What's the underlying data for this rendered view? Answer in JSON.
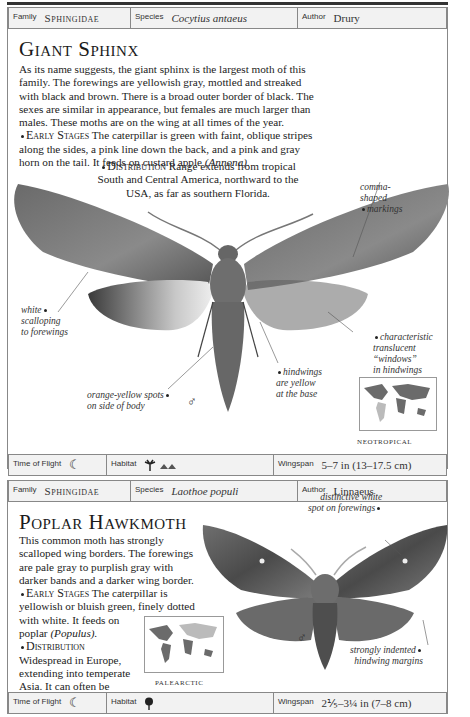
{
  "entries": [
    {
      "family_label": "Family",
      "family": "Sphingidae",
      "species_label": "Species",
      "species": "Cocytius antaeus",
      "author_label": "Author",
      "author": "Drury",
      "title": "Giant Sphinx",
      "description": "As its name suggests, the giant sphinx is the largest moth of this family. The forewings are yellowish gray, mottled and streaked with black and brown. There is a broad outer border of black. The sexes are similar in appearance, but females are much larger than males. These moths are on the wing at all times of the year.",
      "early_stages_heading": "Early Stages",
      "early_stages_text": "The caterpillar is green with faint, oblique stripes along the sides, a pink line down the back, and a pink and gray horn on the tail. It feeds on custard apple",
      "early_stages_host": "(Annona).",
      "distribution_heading": "Distribution",
      "distribution_text_lines": [
        "Range extends from tropical",
        "South and Central America, northward to the",
        "USA, as far as southern Florida."
      ],
      "annotations": {
        "comma": [
          "comma-",
          "shaped",
          "markings"
        ],
        "white": [
          "white",
          "scalloping",
          "to forewings"
        ],
        "windows": [
          "characteristic",
          "translucent",
          "“windows”",
          "in hindwings"
        ],
        "hindwings": [
          "hindwings",
          "are yellow",
          "at the base"
        ],
        "spots": [
          "orange-yellow spots",
          "on side of body"
        ]
      },
      "sex_symbol": "♂",
      "map_label": "NEOTROPICAL",
      "time_of_flight_label": "Time of Flight",
      "time_of_flight_icon": "☾",
      "habitat_label": "Habitat",
      "habitat_icons": [
        "palm-tree-icon",
        "mountains-icon"
      ],
      "wingspan_label": "Wingspan",
      "wingspan": "5–7 in (13–17.5 cm)"
    },
    {
      "family_label": "Family",
      "family": "Sphingidae",
      "species_label": "Species",
      "species": "Laothoe populi",
      "author_label": "Author",
      "author": "Linnaeus",
      "title": "Poplar Hawkmoth",
      "description_lines": [
        "This common moth has strongly",
        "scalloped wing borders. The forewings",
        "are pale gray to purplish gray with",
        "darker bands and a darker wing border."
      ],
      "early_stages_heading": "Early Stages",
      "early_stages_lines": [
        "The caterpillar is",
        "yellowish or bluish green, finely dotted",
        "with white. It feeds on"
      ],
      "early_stages_host_prefix": "poplar",
      "early_stages_host": "(Populus).",
      "distribution_heading": "Distribution",
      "distribution_lines": [
        "Widespread in Europe,",
        "extending into temperate",
        "Asia. It can often be",
        "found in urban areas."
      ],
      "annotations": {
        "spot": [
          "distinctive white",
          "spot on forewings"
        ],
        "margins": [
          "strongly indented",
          "hindwing margins"
        ]
      },
      "sex_symbol": "♂",
      "map_label": "PALEARCTIC",
      "time_of_flight_label": "Time of Flight",
      "time_of_flight_icon": "☾",
      "habitat_label": "Habitat",
      "habitat_icons": [
        "deciduous-tree-icon"
      ],
      "wingspan_label": "Wingspan",
      "wingspan": "2⅕–3¼ in (7–8 cm)"
    }
  ]
}
